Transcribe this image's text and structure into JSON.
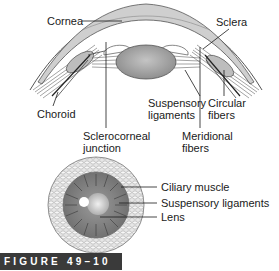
{
  "diagram": {
    "top_view": {
      "labels": {
        "cornea": "Cornea",
        "sclera": "Sclera",
        "choroid": "Choroid",
        "suspensory_1": "Suspensory",
        "suspensory_2": "ligaments",
        "circular_1": "Circular",
        "circular_2": "fibers",
        "sclerocorneal_1": "Sclerocorneal",
        "sclerocorneal_2": "junction",
        "meridional_1": "Meridional",
        "meridional_2": "fibers"
      }
    },
    "cross_section": {
      "labels": {
        "ciliary_muscle": "Ciliary muscle",
        "suspensory_ligaments": "Suspensory ligaments",
        "lens": "Lens"
      }
    },
    "figure_caption": "FIGURE 49–10"
  }
}
